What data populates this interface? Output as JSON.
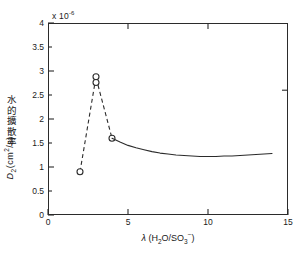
{
  "chart_data": {
    "type": "line",
    "title": "",
    "subtitle": "",
    "xlabel": "λ (H₂O/SO₃⁻)",
    "ylabel": "水的擴散率 D₂(cm²/s)",
    "y_multiplier": "x 10",
    "y_multiplier_exp": "-6",
    "xlim": [
      0,
      15
    ],
    "ylim": [
      0,
      4
    ],
    "xticks": [
      0,
      5,
      10,
      15
    ],
    "xtick_labels": [
      "0",
      "5",
      "10",
      "15"
    ],
    "yticks": [
      0,
      0.5,
      1,
      1.5,
      2,
      2.5,
      3,
      3.5,
      4
    ],
    "ytick_labels": [
      "0",
      "0.5",
      "1",
      "1.5",
      "2",
      "2.5",
      "3",
      "3.5",
      "4"
    ],
    "grid": false,
    "legend": null,
    "series": [
      {
        "name": "measured-points",
        "style": "dashed-with-open-circles",
        "marker": "open-circle",
        "color": "#2b2b2b",
        "points": [
          {
            "x": 2.0,
            "y": 0.9
          },
          {
            "x": 3.0,
            "y": 2.88
          },
          {
            "x": 3.0,
            "y": 2.76
          },
          {
            "x": 4.0,
            "y": 1.6
          }
        ]
      },
      {
        "name": "model-curve",
        "style": "solid",
        "marker": "none",
        "color": "#2b2b2b",
        "points": [
          {
            "x": 4.0,
            "y": 1.6
          },
          {
            "x": 4.5,
            "y": 1.52
          },
          {
            "x": 5.0,
            "y": 1.45
          },
          {
            "x": 5.5,
            "y": 1.4
          },
          {
            "x": 6.0,
            "y": 1.36
          },
          {
            "x": 6.5,
            "y": 1.32
          },
          {
            "x": 7.0,
            "y": 1.29
          },
          {
            "x": 7.5,
            "y": 1.27
          },
          {
            "x": 8.0,
            "y": 1.25
          },
          {
            "x": 8.5,
            "y": 1.24
          },
          {
            "x": 9.0,
            "y": 1.23
          },
          {
            "x": 9.5,
            "y": 1.22
          },
          {
            "x": 10.0,
            "y": 1.22
          },
          {
            "x": 10.5,
            "y": 1.22
          },
          {
            "x": 11.0,
            "y": 1.23
          },
          {
            "x": 11.5,
            "y": 1.23
          },
          {
            "x": 12.0,
            "y": 1.24
          },
          {
            "x": 12.5,
            "y": 1.25
          },
          {
            "x": 13.0,
            "y": 1.26
          },
          {
            "x": 13.5,
            "y": 1.27
          },
          {
            "x": 14.0,
            "y": 1.28
          }
        ]
      }
    ],
    "annotations": []
  },
  "axes": {
    "y_exponent_prefix": "x 10",
    "y_exponent_value": "-6",
    "x_title_lambda": "λ",
    "x_title_open": " (H",
    "x_title_sub2": "2",
    "x_title_mid": "O/SO",
    "x_title_sub3": "3",
    "x_title_sup": "−",
    "x_title_close": ")",
    "y_title_cjk": "水的擴散率",
    "y_title_symbol": "D",
    "y_title_symbol_sub": "2",
    "y_title_unit_open": "(cm",
    "y_title_unit_sup": "2",
    "y_title_unit_close": "/s)"
  },
  "colors": {
    "axis": "#2b2b2b",
    "data": "#2b2b2b",
    "background": "#ffffff"
  }
}
